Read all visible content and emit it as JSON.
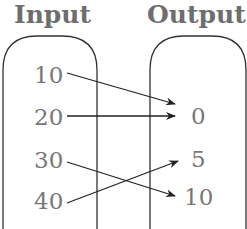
{
  "diagram": {
    "type": "mapping",
    "input_title": "Input",
    "output_title": "Output",
    "inputs": [
      "10",
      "20",
      "30",
      "40"
    ],
    "outputs": [
      "0",
      "5",
      "10"
    ],
    "mappings": [
      {
        "from": "10",
        "to": "0"
      },
      {
        "from": "20",
        "to": "0"
      },
      {
        "from": "30",
        "to": "10"
      },
      {
        "from": "40",
        "to": "5"
      }
    ]
  }
}
